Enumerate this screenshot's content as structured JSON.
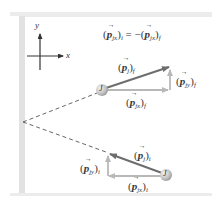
{
  "diagram": {
    "equation": {
      "lhs_symbol": "p",
      "lhs_sub": "jx",
      "lhs_state": "i",
      "rhs": "= −(",
      "rhs_symbol": "p",
      "rhs_sub": "jx",
      "rhs_state": "f"
    },
    "axes": {
      "x_label": "x",
      "y_label": "y"
    },
    "ball_final": {
      "label": "J"
    },
    "ball_initial": {
      "label": "J"
    },
    "labels": {
      "p_f": {
        "symbol": "p",
        "sub": "j",
        "state": "f"
      },
      "p_fy": {
        "symbol": "p",
        "sub": "jy",
        "state": "f"
      },
      "p_fx": {
        "symbol": "p",
        "sub": "jx",
        "state": "f"
      },
      "p_i": {
        "symbol": "p",
        "sub": "j",
        "state": "i"
      },
      "p_iy": {
        "symbol": "p",
        "sub": "jy",
        "state": "i"
      },
      "p_ix": {
        "symbol": "p",
        "sub": "jx",
        "state": "i"
      }
    },
    "colors": {
      "wall": "#e4e4e4",
      "band": "#eeeeee",
      "main_arrow": "#6d6d6d",
      "component_arrow": "#b8b8b8",
      "dashed": "#666666",
      "ball": "#c8c8c8",
      "text": "#3a3a3a"
    }
  }
}
